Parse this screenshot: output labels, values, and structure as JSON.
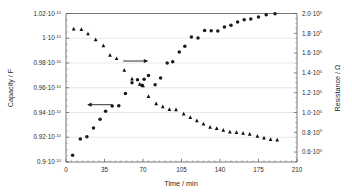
{
  "chart_data": {
    "type": "scatter",
    "title": "",
    "xlabel": "Time / min",
    "ylabel": "Capacity / F",
    "y2label": "Resistance / Ω",
    "xlim": [
      0,
      210
    ],
    "ylim": [
      9e-11,
      1.02e-10
    ],
    "y2lim": [
      50000.0,
      200000.0
    ],
    "grid": true,
    "legend": "none",
    "xticks": [
      0,
      35,
      70,
      105,
      140,
      175,
      210
    ],
    "xtick_labels": [
      "0",
      "35",
      "70",
      "105",
      "140",
      "175",
      "210"
    ],
    "yticks": [
      9e-11,
      9.2e-11,
      9.4e-11,
      9.6e-11,
      9.8e-11,
      1e-10,
      1.02e-10
    ],
    "ytick_labels": [
      {
        "mantissa": "0.9",
        "sep": "·",
        "base": "10",
        "exp": "-10"
      },
      {
        "mantissa": "0.92",
        "sep": "·",
        "base": "10",
        "exp": "-10"
      },
      {
        "mantissa": "0.94",
        "sep": "·",
        "base": "10",
        "exp": "-10"
      },
      {
        "mantissa": "0.96",
        "sep": "·",
        "base": "10",
        "exp": "-10"
      },
      {
        "mantissa": "0.98",
        "sep": "·",
        "base": "10",
        "exp": "-10"
      },
      {
        "mantissa": "1",
        "sep": "·",
        "base": "10",
        "exp": "-10"
      },
      {
        "mantissa": "1.02",
        "sep": "·",
        "base": "10",
        "exp": "-10"
      }
    ],
    "y2ticks": [
      60000.0,
      80000.0,
      100000.0,
      120000.0,
      140000.0,
      160000.0,
      180000.0,
      200000.0
    ],
    "y2tick_labels": [
      {
        "mantissa": "0.6",
        "sep": "·",
        "base": "10",
        "exp": "5"
      },
      {
        "mantissa": "0.8",
        "sep": "·",
        "base": "10",
        "exp": "5"
      },
      {
        "mantissa": "1.0",
        "sep": "·",
        "base": "10",
        "exp": "5"
      },
      {
        "mantissa": "1.2",
        "sep": "·",
        "base": "10",
        "exp": "5"
      },
      {
        "mantissa": "1.4",
        "sep": "·",
        "base": "10",
        "exp": "5"
      },
      {
        "mantissa": "1.6",
        "sep": "·",
        "base": "10",
        "exp": "5"
      },
      {
        "mantissa": "1.8",
        "sep": "·",
        "base": "10",
        "exp": "5"
      },
      {
        "mantissa": "2.0",
        "sep": "·",
        "base": "10",
        "exp": "5"
      }
    ],
    "series": [
      {
        "name": "Capacity",
        "marker": "circle",
        "axis": "left",
        "color": "#1a1a1a",
        "points": [
          [
            6,
            9.055e-11
          ],
          [
            13,
            9.185e-11
          ],
          [
            19,
            9.205e-11
          ],
          [
            25,
            9.275e-11
          ],
          [
            31,
            9.345e-11
          ],
          [
            36,
            9.41e-11
          ],
          [
            42,
            9.452e-11
          ],
          [
            48,
            9.455e-11
          ],
          [
            54,
            9.553e-11
          ],
          [
            60,
            9.64e-11
          ],
          [
            65,
            9.665e-11
          ],
          [
            69,
            9.62e-11
          ],
          [
            71,
            9.668e-11
          ],
          [
            75,
            9.7e-11
          ],
          [
            81,
            9.625e-11
          ],
          [
            86,
            9.678e-11
          ],
          [
            92,
            9.8e-11
          ],
          [
            97,
            9.81e-11
          ],
          [
            103,
            9.888e-11
          ],
          [
            108,
            9.935e-11
          ],
          [
            114,
            1.001e-10
          ],
          [
            120,
            1.0002e-10
          ],
          [
            126,
            1.0062e-10
          ],
          [
            132,
            1.006e-10
          ],
          [
            138,
            1.0058e-10
          ],
          [
            144,
            1.009e-10
          ],
          [
            150,
            1.0105e-10
          ],
          [
            156,
            1.0132e-10
          ],
          [
            162,
            1.015e-10
          ],
          [
            168,
            1.0155e-10
          ],
          [
            175,
            1.0172e-10
          ],
          [
            182,
            1.019e-10
          ],
          [
            190,
            1.0198e-10
          ]
        ]
      },
      {
        "name": "Resistance",
        "marker": "triangle",
        "axis": "right",
        "color": "#101010",
        "points": [
          [
            7,
            184500.0
          ],
          [
            14,
            183800.0
          ],
          [
            20,
            179500.0
          ],
          [
            27,
            173500.0
          ],
          [
            34,
            167500.0
          ],
          [
            40,
            158000.0
          ],
          [
            46,
            154500.0
          ],
          [
            53,
            142800.0
          ],
          [
            60,
            134000.0
          ],
          [
            67,
            128500.0
          ],
          [
            70,
            127200.0
          ],
          [
            75,
            116200.0
          ],
          [
            82,
            108800.0
          ],
          [
            88,
            105800.0
          ],
          [
            94,
            103000.0
          ],
          [
            100,
            102800.0
          ],
          [
            107,
            98500.0
          ],
          [
            113,
            95000.0
          ],
          [
            119,
            91800.0
          ],
          [
            125,
            88500.0
          ],
          [
            131,
            85200.0
          ],
          [
            137,
            84000.0
          ],
          [
            143,
            82200.0
          ],
          [
            149,
            80500.0
          ],
          [
            155,
            79800.0
          ],
          [
            161,
            79000.0
          ],
          [
            167,
            78200.0
          ],
          [
            174,
            76200.0
          ],
          [
            180,
            74200.0
          ],
          [
            186,
            72800.0
          ],
          [
            192,
            72200.0
          ]
        ]
      }
    ],
    "annotations": [
      {
        "name": "resistance-arrow",
        "label": "",
        "direction": "right",
        "x_data": 52,
        "y_right": 152000.0
      },
      {
        "name": "capacity-arrow",
        "label": "",
        "direction": "left",
        "x_data": 42,
        "y_left": 9.463e-11
      }
    ]
  }
}
